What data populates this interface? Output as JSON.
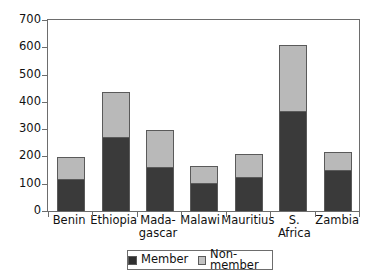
{
  "chart_data": {
    "type": "bar",
    "subtype": "stacked-vertical",
    "title": "",
    "xlabel": "",
    "ylabel": "",
    "ylim": [
      0,
      700
    ],
    "yticks": [
      0,
      100,
      200,
      300,
      400,
      500,
      600,
      700
    ],
    "grid": false,
    "legend_position": "bottom",
    "categories": [
      "Benin",
      "Ethiopia",
      "Madagascar",
      "Malawi",
      "Mauritius",
      "S. Africa",
      "Zambia"
    ],
    "category_labels": [
      {
        "line1": "Benin",
        "line2": ""
      },
      {
        "line1": "Ethiopia",
        "line2": ""
      },
      {
        "line1": "Mada-",
        "line2": "gascar"
      },
      {
        "line1": "Malawi",
        "line2": ""
      },
      {
        "line1": "Mauritius",
        "line2": ""
      },
      {
        "line1": "S. Africa",
        "line2": ""
      },
      {
        "line1": "Zambia",
        "line2": ""
      }
    ],
    "series": [
      {
        "name": "Member",
        "color": "#3a3a3a",
        "values": [
          112,
          268,
          156,
          98,
          120,
          363,
          145
        ]
      },
      {
        "name": "Non-member",
        "color": "#b9b9b9",
        "values": [
          84,
          164,
          138,
          62,
          87,
          243,
          69
        ]
      }
    ],
    "totals": [
      196,
      432,
      294,
      160,
      207,
      606,
      214
    ]
  },
  "axes": {
    "y_tick_labels": [
      "700",
      "600",
      "500",
      "400",
      "300",
      "200",
      "100",
      "0"
    ]
  },
  "legend": {
    "entries": [
      {
        "label": "Member",
        "swatch": "member"
      },
      {
        "label": "Non-member",
        "swatch": "nonmember"
      }
    ]
  },
  "colors": {
    "member": "#3a3a3a",
    "nonmember": "#b9b9b9",
    "axis": "#6d6d6d",
    "background": "#ffffff"
  }
}
